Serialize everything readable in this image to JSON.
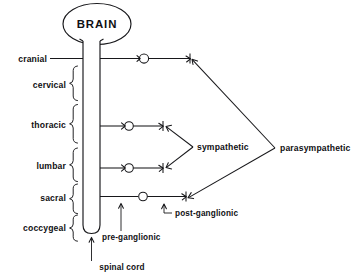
{
  "diagram": {
    "title": "BRAIN",
    "spinal_cord_label": "spinal cord",
    "regions": [
      {
        "id": "cranial",
        "label": "cranial"
      },
      {
        "id": "cervical",
        "label": "cervical"
      },
      {
        "id": "thoracic",
        "label": "thoracic"
      },
      {
        "id": "lumbar",
        "label": "lumbar"
      },
      {
        "id": "sacral",
        "label": "sacral"
      },
      {
        "id": "coccygeal",
        "label": "coccygeal"
      }
    ],
    "branches": [
      {
        "id": "sympathetic",
        "label": "sympathetic"
      },
      {
        "id": "parasympathetic",
        "label": "parasympathetic"
      }
    ],
    "callouts": [
      {
        "id": "pre-ganglionic",
        "label": "pre-ganglionic"
      },
      {
        "id": "post-ganglionic",
        "label": "post-ganglionic"
      }
    ],
    "colors": {
      "ink": "#17171a",
      "background": "#ffffff"
    }
  }
}
